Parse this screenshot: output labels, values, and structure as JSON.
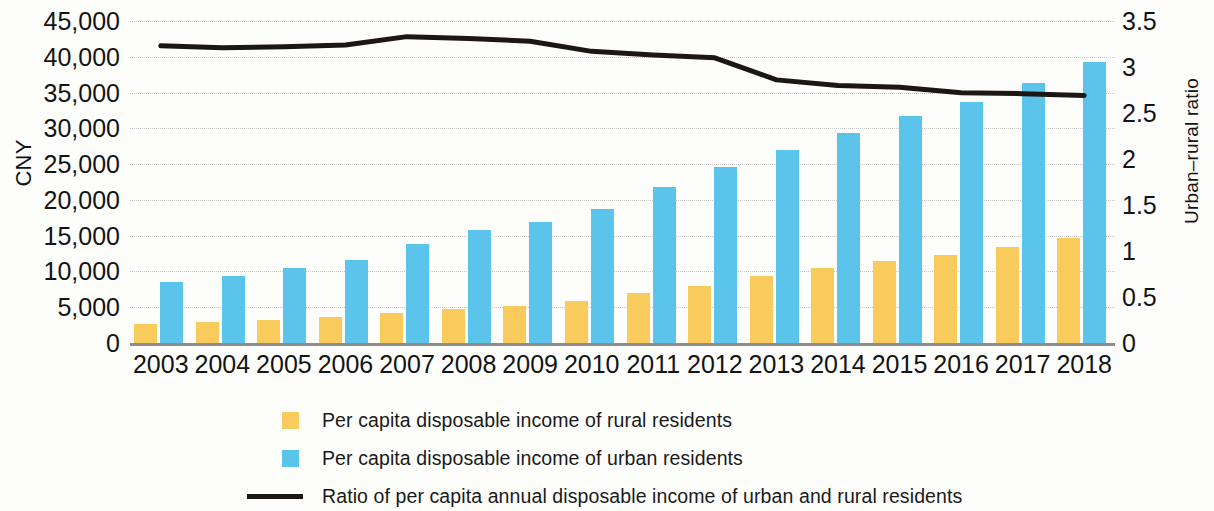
{
  "chart_data": {
    "type": "bar",
    "title": "",
    "categories": [
      "2003",
      "2004",
      "2005",
      "2006",
      "2007",
      "2008",
      "2009",
      "2010",
      "2011",
      "2012",
      "2013",
      "2014",
      "2015",
      "2016",
      "2017",
      "2018"
    ],
    "ylabel": "CNY",
    "ylabel_secondary": "Urban–rural ratio",
    "xlabel": "",
    "ylim": [
      0,
      45000
    ],
    "ylim_secondary": [
      0,
      3.5
    ],
    "yticks": [
      "0",
      "5,000",
      "10,000",
      "15,000",
      "20,000",
      "25,000",
      "30,000",
      "35,000",
      "40,000",
      "45,000"
    ],
    "ytick_values": [
      0,
      5000,
      10000,
      15000,
      20000,
      25000,
      30000,
      35000,
      40000,
      45000
    ],
    "yticks_secondary": [
      "0",
      "0.5",
      "1",
      "1.5",
      "2",
      "2.5",
      "3",
      "3.5"
    ],
    "ytick_values_secondary": [
      0,
      0.5,
      1,
      1.5,
      2,
      2.5,
      3,
      3.5
    ],
    "grid": true,
    "legend_position": "bottom",
    "series": [
      {
        "name": "Per capita disposable income of rural residents",
        "type": "bar",
        "color": "#f8cb5c",
        "axis": "left",
        "values": [
          2622,
          2936,
          3255,
          3587,
          4140,
          4761,
          5153,
          5919,
          6977,
          7917,
          9430,
          10489,
          11422,
          12363,
          13432,
          14617
        ]
      },
      {
        "name": "Per capita disposable income of urban residents",
        "type": "bar",
        "color": "#5bc4ea",
        "axis": "left",
        "values": [
          8472,
          9422,
          10493,
          11620,
          13786,
          15781,
          16901,
          18779,
          21810,
          24565,
          26955,
          29381,
          31790,
          33616,
          36396,
          39251
        ]
      },
      {
        "name": "Ratio of per capita annual disposable income of urban and rural residents",
        "type": "line",
        "color": "#1c1713",
        "axis": "right",
        "values": [
          3.23,
          3.21,
          3.22,
          3.24,
          3.33,
          3.31,
          3.28,
          3.17,
          3.13,
          3.1,
          2.86,
          2.8,
          2.78,
          2.72,
          2.71,
          2.69
        ]
      }
    ]
  },
  "legend": {
    "items": [
      {
        "label": "Per capita disposable income of rural residents",
        "swatch": "rural"
      },
      {
        "label": "Per capita disposable income of urban residents",
        "swatch": "urban"
      },
      {
        "label": "Ratio of per capita annual disposable income of urban and rural residents",
        "swatch": "line"
      }
    ]
  }
}
